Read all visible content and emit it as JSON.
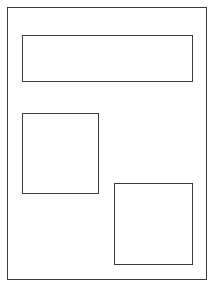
{
  "page": {
    "width": 211,
    "height": 284,
    "background": "#ffffff",
    "line_color": "#3a3a3a"
  },
  "outer_frame": {
    "x": 7,
    "y": 7,
    "w": 200,
    "h": 273
  },
  "boxes": [
    {
      "name": "top-banner-box",
      "x": 22,
      "y": 35,
      "w": 171,
      "h": 47
    },
    {
      "name": "middle-left-box",
      "x": 22,
      "y": 113,
      "w": 77,
      "h": 81
    },
    {
      "name": "bottom-right-box",
      "x": 114,
      "y": 183,
      "w": 79,
      "h": 82
    }
  ]
}
